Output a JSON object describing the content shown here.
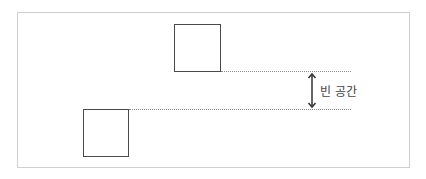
{
  "diagram": {
    "label": "빈 공간",
    "colors": {
      "frame": "#cfcfcf",
      "box_stroke": "#4a4a4a",
      "guide_line": "#8a8a8a",
      "arrow": "#333333",
      "text": "#444444"
    },
    "elements": {
      "top_box": "square",
      "bottom_box": "square",
      "arrow": "double-headed vertical arrow"
    }
  }
}
